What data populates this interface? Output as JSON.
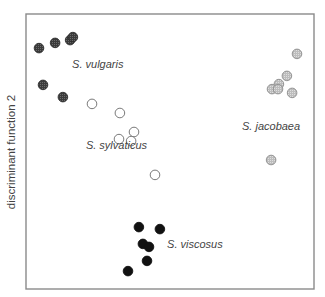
{
  "chart_data": {
    "type": "scatter",
    "title": "",
    "xlabel": "",
    "ylabel": "discriminant function 2",
    "grid": false,
    "legend": "none (groups labeled directly on plot)",
    "xlim": [
      0,
      100
    ],
    "ylim": [
      0,
      100
    ],
    "series": [
      {
        "name": "S. vulgaris",
        "marker": "filled-dark-stippled",
        "color": "#4a4a4a",
        "points": [
          [
            4.5,
            87.6
          ],
          [
            10.1,
            89.5
          ],
          [
            15.3,
            90.5
          ],
          [
            16.3,
            91.6
          ],
          [
            5.9,
            74.2
          ],
          [
            12.8,
            69.8
          ]
        ]
      },
      {
        "name": "S. jacobaea",
        "marker": "filled-light-stippled",
        "color": "#c8c8c8",
        "points": [
          [
            94.1,
            85.5
          ],
          [
            90.6,
            77.5
          ],
          [
            87.8,
            74.5
          ],
          [
            85.4,
            72.7
          ],
          [
            87.5,
            72.7
          ],
          [
            92.4,
            71.3
          ],
          [
            85.1,
            46.9
          ]
        ]
      },
      {
        "name": "S. sylvaticus",
        "marker": "open-circle",
        "color": "#ffffff",
        "points": [
          [
            22.9,
            67.3
          ],
          [
            32.6,
            64.0
          ],
          [
            37.5,
            57.1
          ],
          [
            32.3,
            54.5
          ],
          [
            36.5,
            53.8
          ],
          [
            44.8,
            41.5
          ]
        ]
      },
      {
        "name": "S. viscosus",
        "marker": "filled-black",
        "color": "#111111",
        "points": [
          [
            39.2,
            22.5
          ],
          [
            46.5,
            21.8
          ],
          [
            40.6,
            16.4
          ],
          [
            42.7,
            15.3
          ],
          [
            42.0,
            10.2
          ],
          [
            35.4,
            6.5
          ]
        ]
      }
    ],
    "annotations": [
      {
        "text": "S. vulgaris",
        "x": 16.0,
        "y": 80.4
      },
      {
        "text": "S. jacobaea",
        "x": 75.0,
        "y": 57.8
      },
      {
        "text": "S. sylvaticus",
        "x": 20.8,
        "y": 50.9
      },
      {
        "text": "S. viscosus",
        "x": 49.0,
        "y": 14.9
      }
    ]
  }
}
